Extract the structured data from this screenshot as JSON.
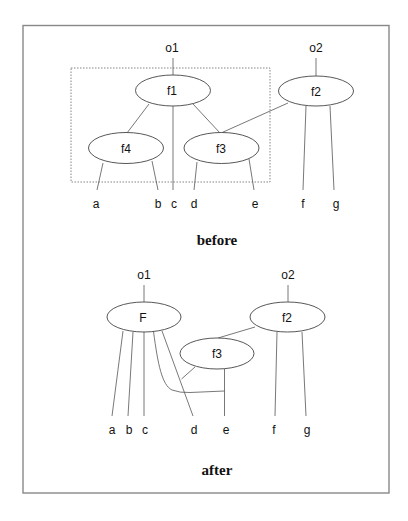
{
  "frame": {
    "border_color": "#888888"
  },
  "before": {
    "caption": "before",
    "roots": [
      {
        "id": "o1",
        "label": "o1"
      },
      {
        "id": "o2",
        "label": "o2"
      }
    ],
    "nodes": [
      {
        "id": "f1",
        "label": "f1"
      },
      {
        "id": "f2",
        "label": "f2"
      },
      {
        "id": "f3",
        "label": "f3"
      },
      {
        "id": "f4",
        "label": "f4"
      }
    ],
    "leaves": [
      {
        "id": "a",
        "label": "a"
      },
      {
        "id": "b",
        "label": "b"
      },
      {
        "id": "c",
        "label": "c"
      },
      {
        "id": "d",
        "label": "d"
      },
      {
        "id": "e",
        "label": "e"
      },
      {
        "id": "f",
        "label": "f"
      },
      {
        "id": "g",
        "label": "g"
      }
    ],
    "edges": [
      [
        "o1",
        "f1"
      ],
      [
        "f1",
        "f4"
      ],
      [
        "f1",
        "c"
      ],
      [
        "f1",
        "f3"
      ],
      [
        "f2",
        "f3"
      ],
      [
        "f4",
        "a"
      ],
      [
        "f4",
        "b"
      ],
      [
        "f3",
        "d"
      ],
      [
        "f3",
        "e"
      ],
      [
        "o2",
        "f2"
      ],
      [
        "f2",
        "f"
      ],
      [
        "f2",
        "g"
      ]
    ],
    "grouped_region": [
      "f1",
      "f3",
      "f4"
    ]
  },
  "after": {
    "caption": "after",
    "roots": [
      {
        "id": "o1",
        "label": "o1"
      },
      {
        "id": "o2",
        "label": "o2"
      }
    ],
    "nodes": [
      {
        "id": "F",
        "label": "F"
      },
      {
        "id": "f2",
        "label": "f2"
      },
      {
        "id": "f3",
        "label": "f3"
      }
    ],
    "leaves": [
      {
        "id": "a",
        "label": "a"
      },
      {
        "id": "b",
        "label": "b"
      },
      {
        "id": "c",
        "label": "c"
      },
      {
        "id": "d",
        "label": "d"
      },
      {
        "id": "e",
        "label": "e"
      },
      {
        "id": "f",
        "label": "f"
      },
      {
        "id": "g",
        "label": "g"
      }
    ],
    "edges": [
      [
        "o1",
        "F"
      ],
      [
        "F",
        "a"
      ],
      [
        "F",
        "b"
      ],
      [
        "F",
        "c"
      ],
      [
        "F",
        "d"
      ],
      [
        "F",
        "e"
      ],
      [
        "f3",
        "d"
      ],
      [
        "f3",
        "e"
      ],
      [
        "f2",
        "f3"
      ],
      [
        "o2",
        "f2"
      ],
      [
        "f2",
        "f"
      ],
      [
        "f2",
        "g"
      ]
    ]
  }
}
